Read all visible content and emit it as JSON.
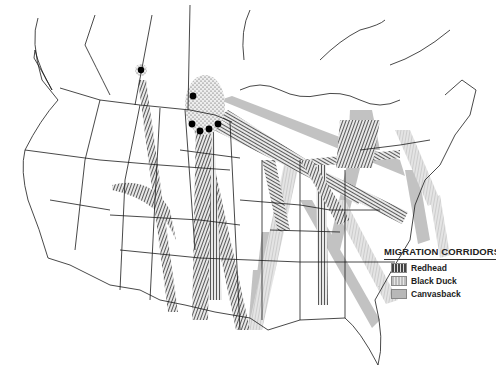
{
  "map": {
    "title": "Migration Corridors of North American Waterfowl",
    "region": "United States and southern Canada",
    "breeding_sites": [
      {
        "x": 141,
        "y": 70
      },
      {
        "x": 193,
        "y": 96
      },
      {
        "x": 192,
        "y": 124
      },
      {
        "x": 200,
        "y": 131
      },
      {
        "x": 209,
        "y": 129
      },
      {
        "x": 218,
        "y": 124
      }
    ]
  },
  "legend": {
    "title": "MIGRATION CORRIDORS",
    "items": [
      {
        "label": "Redhead",
        "pattern": "dense-dark-hatch",
        "color": "#555555"
      },
      {
        "label": "Black Duck",
        "pattern": "light-hatch",
        "color": "#c8c8c8"
      },
      {
        "label": "Canvasback",
        "pattern": "solid-gray",
        "color": "#b4b4b4"
      }
    ]
  },
  "colors": {
    "background": "#ffffff",
    "boundaries": "#1a1a1a",
    "redhead": "#4a4a4a",
    "black_duck": "#cfcfcf",
    "canvasback": "#b0b0b0"
  }
}
